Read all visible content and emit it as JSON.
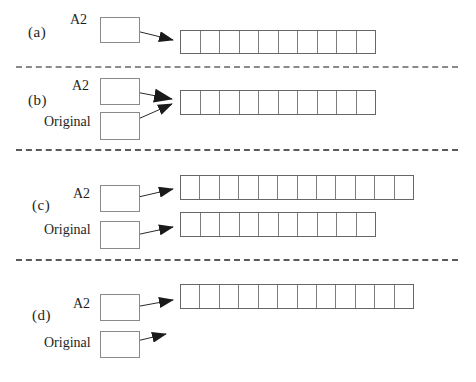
{
  "figure": {
    "colors": {
      "line_color": "#2a2a2a",
      "box_border_color": "#8a8a8a",
      "array_border_color": "#666666",
      "cell_divider_color": "#7d7d7d",
      "separator_color": "#8a8a8a",
      "background": "#ffffff"
    },
    "panels": [
      {
        "label": "(a)",
        "pointers": [
          {
            "name": "A2"
          }
        ],
        "arrays": [
          {
            "cells": 10
          }
        ]
      },
      {
        "label": "(b)",
        "pointers": [
          {
            "name": "A2"
          },
          {
            "name": "Original"
          }
        ],
        "arrays": [
          {
            "cells": 10
          }
        ]
      },
      {
        "label": "(c)",
        "pointers": [
          {
            "name": "A2"
          },
          {
            "name": "Original"
          }
        ],
        "arrays": [
          {
            "cells": 12
          },
          {
            "cells": 10
          }
        ]
      },
      {
        "label": "(d)",
        "pointers": [
          {
            "name": "A2"
          },
          {
            "name": "Original"
          }
        ],
        "arrays": [
          {
            "cells": 12
          }
        ]
      }
    ]
  }
}
